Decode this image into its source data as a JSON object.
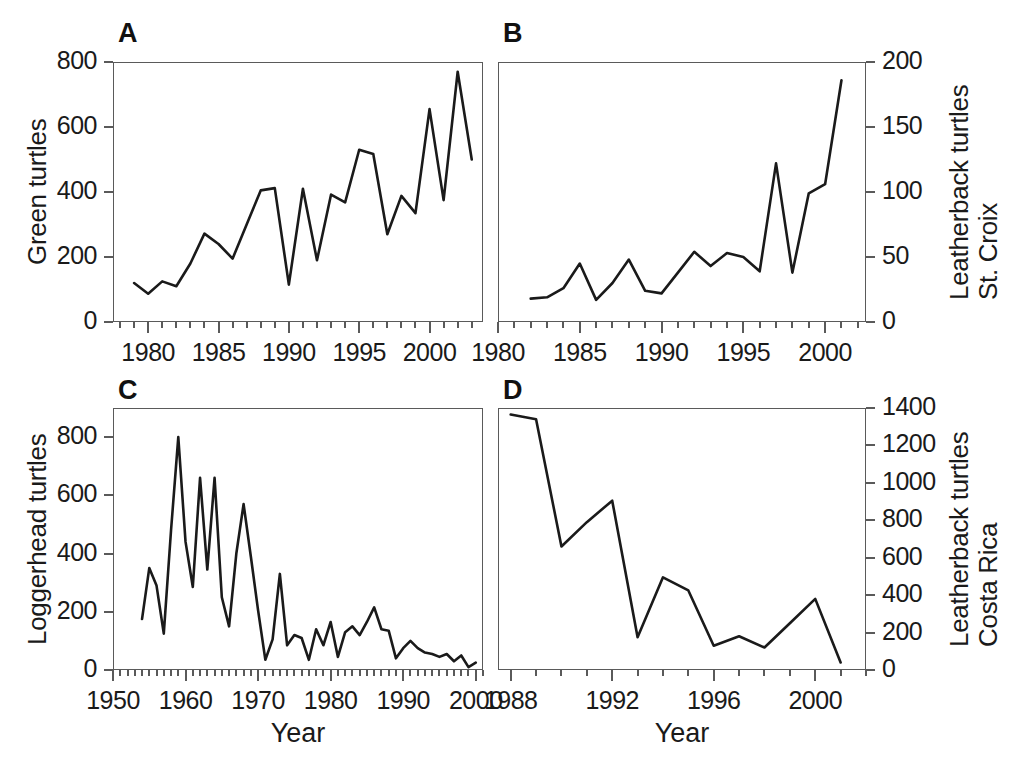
{
  "figure": {
    "background_color": "#ffffff",
    "line_color": "#1a1a1a",
    "axis_color": "#5a5a5a",
    "xlabel_left": "Year",
    "xlabel_right": "Year"
  },
  "panels": {
    "A": {
      "letter": "A",
      "ylabel": "Green turtles",
      "ylabel_line2": "",
      "xlabel": "Year",
      "yticks": [
        "0",
        "200",
        "400",
        "600",
        "800"
      ],
      "xticks": [
        "1980",
        "1985",
        "1990",
        "1995",
        "2000"
      ]
    },
    "B": {
      "letter": "B",
      "ylabel": "Leatherback turtles",
      "ylabel_line2": "St. Croix",
      "xlabel": "Year",
      "yticks": [
        "0",
        "50",
        "100",
        "150",
        "200"
      ],
      "xticks": [
        "1980",
        "1985",
        "1990",
        "1995",
        "2000"
      ]
    },
    "C": {
      "letter": "C",
      "ylabel": "Loggerhead turtles",
      "ylabel_line2": "",
      "xlabel": "Year",
      "yticks": [
        "0",
        "200",
        "400",
        "600",
        "800"
      ],
      "xticks": [
        "1950",
        "1960",
        "1970",
        "1980",
        "1990",
        "2000"
      ]
    },
    "D": {
      "letter": "D",
      "ylabel": "Leatherback turtles",
      "ylabel_line2": "Costa Rica",
      "xlabel": "Year",
      "yticks": [
        "0",
        "200",
        "400",
        "600",
        "800",
        "1000",
        "1200",
        "1400"
      ],
      "xticks": [
        "1988",
        "1992",
        "1996",
        "2000"
      ]
    }
  },
  "chart_data": [
    {
      "id": "A",
      "type": "line",
      "title": "A",
      "xlabel": "Year",
      "ylabel": "Green turtles",
      "xlim": [
        1977.5,
        2003.8
      ],
      "ylim": [
        0,
        800
      ],
      "ytick_values": [
        0,
        200,
        400,
        600,
        800
      ],
      "xtick_values": [
        1980,
        1985,
        1990,
        1995,
        2000
      ],
      "xminor_step": 1,
      "grid": false,
      "legend": "none",
      "x": [
        1979,
        1980,
        1981,
        1982,
        1983,
        1984,
        1985,
        1986,
        1987,
        1988,
        1989,
        1990,
        1991,
        1992,
        1993,
        1994,
        1995,
        1996,
        1997,
        1998,
        1999,
        2000,
        2001,
        2002,
        2003
      ],
      "values": [
        120,
        87,
        125,
        110,
        180,
        272,
        240,
        195,
        300,
        405,
        412,
        115,
        410,
        190,
        392,
        368,
        530,
        517,
        270,
        388,
        335,
        655,
        375,
        770,
        500
      ]
    },
    {
      "id": "B",
      "type": "line",
      "title": "B",
      "xlabel": "Year",
      "ylabel": "Leatherback turtles St. Croix",
      "xlim": [
        1980,
        2002.5
      ],
      "ylim": [
        0,
        200
      ],
      "ytick_values": [
        0,
        50,
        100,
        150,
        200
      ],
      "xtick_values": [
        1980,
        1985,
        1990,
        1995,
        2000
      ],
      "xminor_step": 1,
      "grid": false,
      "legend": "none",
      "x": [
        1982,
        1983,
        1984,
        1985,
        1986,
        1987,
        1988,
        1989,
        1990,
        1991,
        1992,
        1993,
        1994,
        1995,
        1996,
        1997,
        1998,
        1999,
        2000,
        2001
      ],
      "values": [
        18,
        19,
        26,
        45,
        17,
        30,
        48,
        24,
        22,
        38,
        54,
        43,
        53,
        50,
        39,
        122,
        38,
        99,
        106,
        186
      ]
    },
    {
      "id": "C",
      "type": "line",
      "title": "C",
      "xlabel": "Year",
      "ylabel": "Loggerhead turtles",
      "xlim": [
        1950,
        2001
      ],
      "ylim": [
        0,
        900
      ],
      "ytick_values": [
        0,
        200,
        400,
        600,
        800
      ],
      "xtick_values": [
        1950,
        1960,
        1970,
        1980,
        1990,
        2000
      ],
      "xminor_step": 1,
      "grid": false,
      "legend": "none",
      "x": [
        1954,
        1955,
        1956,
        1957,
        1958,
        1959,
        1960,
        1961,
        1962,
        1963,
        1964,
        1965,
        1966,
        1967,
        1968,
        1969,
        1970,
        1971,
        1972,
        1973,
        1974,
        1975,
        1976,
        1977,
        1978,
        1979,
        1980,
        1981,
        1982,
        1983,
        1984,
        1985,
        1986,
        1987,
        1988,
        1989,
        1990,
        1991,
        1992,
        1993,
        1994,
        1995,
        1996,
        1997,
        1998,
        1999,
        2000
      ],
      "values": [
        175,
        350,
        290,
        125,
        480,
        800,
        440,
        285,
        660,
        345,
        660,
        250,
        150,
        400,
        570,
        390,
        205,
        35,
        105,
        330,
        85,
        120,
        110,
        35,
        140,
        85,
        165,
        45,
        130,
        150,
        120,
        165,
        215,
        140,
        135,
        40,
        75,
        100,
        75,
        60,
        55,
        45,
        55,
        30,
        50,
        10,
        25
      ]
    },
    {
      "id": "D",
      "type": "line",
      "title": "D",
      "xlabel": "Year",
      "ylabel": "Leatherback turtles Costa Rica",
      "xlim": [
        1987.5,
        2002
      ],
      "ylim": [
        0,
        1400
      ],
      "ytick_values": [
        0,
        200,
        400,
        600,
        800,
        1000,
        1200,
        1400
      ],
      "xtick_values": [
        1988,
        1992,
        1996,
        2000
      ],
      "xminor_step": 1,
      "grid": false,
      "legend": "none",
      "x": [
        1988,
        1989,
        1990,
        1991,
        1992,
        1993,
        1994,
        1995,
        1996,
        1997,
        1998,
        1999,
        2000,
        2001
      ],
      "values": [
        1365,
        1340,
        660,
        790,
        905,
        175,
        495,
        425,
        130,
        180,
        120,
        250,
        380,
        40
      ]
    }
  ]
}
